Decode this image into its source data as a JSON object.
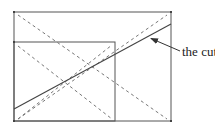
{
  "diagram": {
    "label": "the cut",
    "colors": {
      "stroke": "#555555",
      "dash": "#777777",
      "text": "#222222"
    },
    "outer_rect": {
      "x": 14,
      "y": 12,
      "w": 157,
      "h": 109
    },
    "inner_rect": {
      "x": 14,
      "y": 42,
      "w": 101,
      "h": 79
    },
    "cut_line": {
      "x1": 14,
      "y1": 109,
      "x2": 171,
      "y2": 24
    },
    "dashed_lines": [
      {
        "x1": 18,
        "y1": 15,
        "x2": 167,
        "y2": 119
      },
      {
        "x1": 18,
        "y1": 119,
        "x2": 167,
        "y2": 15
      },
      {
        "x1": 18,
        "y1": 46,
        "x2": 112,
        "y2": 119
      },
      {
        "x1": 18,
        "y1": 119,
        "x2": 112,
        "y2": 45
      }
    ],
    "arrow": {
      "x1": 180,
      "y1": 51,
      "x2": 150,
      "y2": 38
    }
  }
}
